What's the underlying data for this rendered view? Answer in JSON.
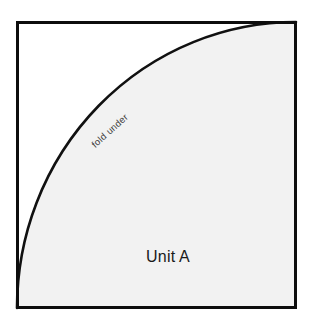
{
  "figure": {
    "type": "sewing-pattern-piece",
    "background_color": "#ffffff",
    "frame": {
      "name": "pattern-block-outline",
      "shape": "rectangle",
      "stroke_color": "#0d0d0d",
      "stroke_width": 3,
      "x": 16,
      "y": 21,
      "width": 281,
      "height": 288
    },
    "curve": {
      "name": "fold-under-curve",
      "description": "quarter-ellipse arc from bottom-left corner to top-right corner",
      "stroke_color": "#111111",
      "stroke_width": 2.6,
      "start_x": 17,
      "start_y": 308,
      "end_x": 296,
      "end_y": 22
    },
    "region": {
      "name": "unit-a-region",
      "fill_color": "#f2f2f2",
      "outer_fill_color": "#ffffff"
    },
    "labels": {
      "fold_under": {
        "text": "fold under",
        "x": 112,
        "y": 133,
        "rotation_deg": -42,
        "color": "#3a3a3a",
        "font_size": 9.5
      },
      "unit_a": {
        "text": "Unit A",
        "x": 168,
        "y": 262,
        "rotation_deg": 0,
        "color": "#1b1b1b",
        "font_size": 16
      }
    }
  }
}
